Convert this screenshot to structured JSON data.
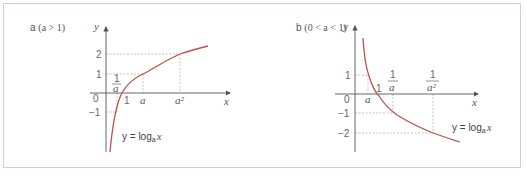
{
  "panels": [
    {
      "id": "a",
      "label_letter": "a",
      "condition": "(a > 1)",
      "axis_x": "x",
      "axis_y": "y",
      "origin": "0",
      "y_ticks": [
        "2",
        "1",
        "−1"
      ],
      "x_ticks": [
        "1",
        "a",
        "a²"
      ],
      "fraction_label": {
        "num": "1",
        "den": "a"
      },
      "equation": "y = log",
      "equation_sub": "a",
      "equation_var": "x",
      "curve_color": "#b5564a"
    },
    {
      "id": "b",
      "label_letter": "b",
      "condition": "(0 < a < 1)",
      "axis_x": "x",
      "axis_y": "y",
      "origin": "0",
      "y_ticks": [
        "1",
        "−1",
        "−2"
      ],
      "x_ticks": [
        "a",
        "1"
      ],
      "fraction_labels": [
        {
          "num": "1",
          "den": "a"
        },
        {
          "num": "1",
          "den": "a²"
        }
      ],
      "equation": "y = log",
      "equation_sub": "a",
      "equation_var": "x",
      "curve_color": "#b5564a"
    }
  ],
  "colors": {
    "border": "#e6c8c8",
    "axis": "#555555",
    "guide": "#aaaaaa",
    "curve": "#b5564a"
  }
}
